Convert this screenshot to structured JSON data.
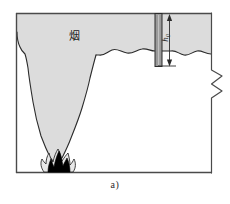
{
  "figure": {
    "caption": "a)",
    "smoke_label": "烟",
    "height_label": "h",
    "height_subscript": "0",
    "labels": {
      "smoke_layer": "烟",
      "dimension": "h0",
      "panel": "a)"
    },
    "colors": {
      "smoke_fill": "#dcdcdc",
      "smoke_stroke": "#2b2b2b",
      "baffle_fill": "#9a9a9a",
      "baffle_stroke": "#2b2b2b",
      "flame_fill": "#000000",
      "wall_stroke": "#4a4a4a",
      "background": "#ffffff",
      "text": "#2b2b2b"
    },
    "geometry": {
      "room_left": 16,
      "room_top": 13,
      "room_right": 212,
      "room_floor": 173,
      "baffle_x": 155,
      "baffle_width": 7,
      "baffle_bottom": 66,
      "smoke_interface_y": 52,
      "break_x": 212
    }
  }
}
